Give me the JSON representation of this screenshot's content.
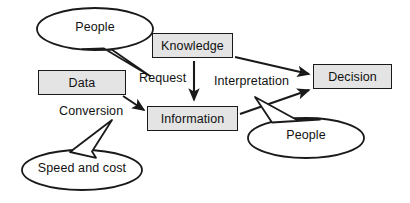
{
  "diagram": {
    "colors": {
      "box_fill": "#e4e4e4",
      "stroke": "#1a1a1a",
      "text": "#111111",
      "background": "#ffffff"
    },
    "nodes": [
      {
        "id": "data",
        "label": "Data"
      },
      {
        "id": "knowledge",
        "label": "Knowledge"
      },
      {
        "id": "information",
        "label": "Information"
      },
      {
        "id": "decision",
        "label": "Decision"
      }
    ],
    "edge_labels": [
      {
        "id": "request",
        "label": "Request"
      },
      {
        "id": "interpretation",
        "label": "Interpretation"
      },
      {
        "id": "conversion",
        "label": "Conversion"
      }
    ],
    "callouts": [
      {
        "id": "people-top",
        "label": "People"
      },
      {
        "id": "people-bottom",
        "label": "People"
      },
      {
        "id": "speed-and-cost",
        "label": "Speed and cost"
      }
    ]
  }
}
